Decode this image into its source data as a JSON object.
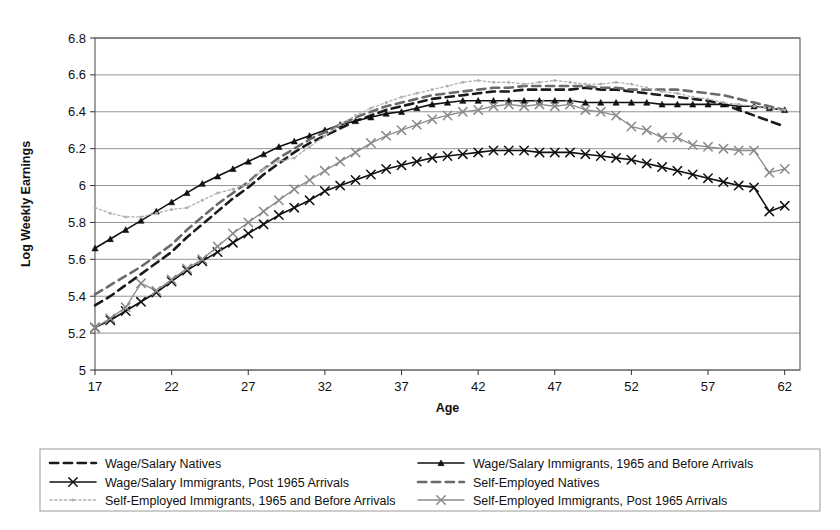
{
  "chart_data": {
    "type": "line",
    "title": "",
    "xlabel": "Age",
    "ylabel": "Log Weekly Earnings",
    "xlim": [
      17,
      63
    ],
    "ylim": [
      5.0,
      6.8
    ],
    "ytick_labels": [
      "5",
      "5.2",
      "5.4",
      "5.6",
      "5.8",
      "6",
      "6.2",
      "6.4",
      "6.6",
      "6.8"
    ],
    "ytick_values": [
      5.0,
      5.2,
      5.4,
      5.6,
      5.8,
      6.0,
      6.2,
      6.4,
      6.6,
      6.8
    ],
    "xtick_labels": [
      "17",
      "22",
      "27",
      "32",
      "37",
      "42",
      "47",
      "52",
      "57",
      "62"
    ],
    "xtick_values": [
      17,
      22,
      27,
      32,
      37,
      42,
      47,
      52,
      57,
      62
    ],
    "grid": "horizontal",
    "legend_position": "below",
    "x": [
      17,
      18,
      19,
      20,
      21,
      22,
      23,
      24,
      25,
      26,
      27,
      28,
      29,
      30,
      31,
      32,
      33,
      34,
      35,
      36,
      37,
      38,
      39,
      40,
      41,
      42,
      43,
      44,
      45,
      46,
      47,
      48,
      49,
      50,
      51,
      52,
      53,
      54,
      55,
      56,
      57,
      58,
      59,
      60,
      61,
      62
    ],
    "series": [
      {
        "name": "Wage/Salary Natives",
        "style": "dashed",
        "color": "#1a1a1a",
        "marker": "none",
        "width": 2.6,
        "values": [
          5.35,
          5.4,
          5.46,
          5.52,
          5.58,
          5.64,
          5.72,
          5.79,
          5.86,
          5.93,
          5.99,
          6.06,
          6.12,
          6.18,
          6.23,
          6.27,
          6.31,
          6.35,
          6.38,
          6.41,
          6.43,
          6.45,
          6.47,
          6.48,
          6.49,
          6.5,
          6.51,
          6.51,
          6.52,
          6.52,
          6.52,
          6.52,
          6.53,
          6.52,
          6.52,
          6.51,
          6.5,
          6.49,
          6.48,
          6.47,
          6.46,
          6.44,
          6.41,
          6.38,
          6.35,
          6.32
        ]
      },
      {
        "name": "Wage/Salary Immigrants, 1965 and Before Arrivals",
        "style": "solid",
        "color": "#111111",
        "marker": "triangle",
        "width": 1.6,
        "values": [
          5.66,
          5.71,
          5.76,
          5.81,
          5.86,
          5.91,
          5.96,
          6.01,
          6.05,
          6.09,
          6.13,
          6.17,
          6.21,
          6.24,
          6.27,
          6.3,
          6.33,
          6.35,
          6.37,
          6.39,
          6.4,
          6.42,
          6.44,
          6.45,
          6.46,
          6.46,
          6.46,
          6.46,
          6.46,
          6.46,
          6.46,
          6.46,
          6.45,
          6.45,
          6.45,
          6.45,
          6.45,
          6.44,
          6.44,
          6.44,
          6.44,
          6.44,
          6.43,
          6.43,
          6.42,
          6.41
        ]
      },
      {
        "name": "Wage/Salary Immigrants, Post 1965 Arrivals",
        "style": "solid",
        "color": "#111111",
        "marker": "x",
        "width": 1.6,
        "values": [
          5.23,
          5.27,
          5.32,
          5.37,
          5.42,
          5.48,
          5.54,
          5.59,
          5.64,
          5.69,
          5.74,
          5.79,
          5.84,
          5.88,
          5.92,
          5.97,
          6.0,
          6.03,
          6.06,
          6.09,
          6.11,
          6.13,
          6.15,
          6.16,
          6.17,
          6.18,
          6.19,
          6.19,
          6.19,
          6.18,
          6.18,
          6.18,
          6.17,
          6.16,
          6.15,
          6.14,
          6.12,
          6.1,
          6.08,
          6.06,
          6.04,
          6.02,
          6.0,
          5.99,
          5.86,
          5.89
        ]
      },
      {
        "name": "Self-Employed Natives",
        "style": "dashed",
        "color": "#6a6a6a",
        "marker": "none",
        "width": 2.6,
        "values": [
          5.41,
          5.46,
          5.51,
          5.56,
          5.62,
          5.68,
          5.76,
          5.83,
          5.9,
          5.96,
          6.02,
          6.09,
          6.15,
          6.2,
          6.25,
          6.29,
          6.33,
          6.37,
          6.4,
          6.43,
          6.45,
          6.47,
          6.49,
          6.5,
          6.51,
          6.52,
          6.53,
          6.53,
          6.54,
          6.54,
          6.54,
          6.54,
          6.54,
          6.53,
          6.53,
          6.52,
          6.52,
          6.52,
          6.52,
          6.51,
          6.5,
          6.49,
          6.47,
          6.45,
          6.43,
          6.41
        ]
      },
      {
        "name": "Self-Employed Immigrants, 1965 and Before Arrivals",
        "style": "dotted",
        "color": "#b0b0b0",
        "marker": "tiny",
        "width": 1.3,
        "values": [
          5.88,
          5.85,
          5.83,
          5.83,
          5.85,
          5.87,
          5.88,
          5.92,
          5.96,
          5.98,
          6.01,
          6.09,
          6.13,
          6.15,
          6.21,
          6.27,
          6.33,
          6.38,
          6.42,
          6.45,
          6.48,
          6.5,
          6.52,
          6.54,
          6.56,
          6.57,
          6.56,
          6.56,
          6.55,
          6.56,
          6.57,
          6.56,
          6.55,
          6.55,
          6.56,
          6.55,
          6.53,
          6.51,
          6.5,
          6.48,
          6.47,
          6.45,
          6.44,
          6.43,
          6.42,
          6.41
        ]
      },
      {
        "name": "Self-Employed Immigrants, Post 1965 Arrivals",
        "style": "solid",
        "color": "#8a8a8a",
        "marker": "x",
        "width": 1.3,
        "values": [
          5.23,
          5.28,
          5.34,
          5.47,
          5.43,
          5.49,
          5.55,
          5.6,
          5.67,
          5.74,
          5.8,
          5.86,
          5.92,
          5.98,
          6.03,
          6.08,
          6.13,
          6.18,
          6.23,
          6.27,
          6.3,
          6.33,
          6.36,
          6.38,
          6.4,
          6.41,
          6.43,
          6.44,
          6.43,
          6.44,
          6.43,
          6.44,
          6.41,
          6.4,
          6.38,
          6.32,
          6.3,
          6.26,
          6.26,
          6.22,
          6.21,
          6.2,
          6.19,
          6.19,
          6.07,
          6.09
        ]
      }
    ]
  },
  "legend": {
    "entries": [
      {
        "label": "Wage/Salary Natives",
        "style": "dashed",
        "color": "#1a1a1a",
        "marker": "none",
        "width": 2.6
      },
      {
        "label": "Wage/Salary Immigrants, 1965 and Before Arrivals",
        "style": "solid",
        "color": "#111111",
        "marker": "triangle",
        "width": 1.6
      },
      {
        "label": "Wage/Salary Immigrants, Post 1965 Arrivals",
        "style": "solid",
        "color": "#111111",
        "marker": "x",
        "width": 1.6
      },
      {
        "label": "Self-Employed Natives",
        "style": "dashed",
        "color": "#6a6a6a",
        "marker": "none",
        "width": 2.6
      },
      {
        "label": "Self-Employed Immigrants, 1965 and Before Arrivals",
        "style": "dotted",
        "color": "#b0b0b0",
        "marker": "tiny",
        "width": 1.3
      },
      {
        "label": "Self-Employed Immigrants, Post 1965 Arrivals",
        "style": "solid",
        "color": "#8a8a8a",
        "marker": "x",
        "width": 1.3
      }
    ]
  },
  "style": {
    "plot_border_color": "#555555",
    "gridline_color": "#888888",
    "legend_border_color": "#9a9a9a",
    "background": "#ffffff"
  }
}
